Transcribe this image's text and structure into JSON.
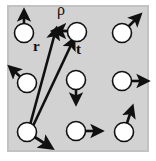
{
  "figure": {
    "kind": "spin-lattice-vector-diagram",
    "width": 156,
    "height": 161,
    "background_color": "#ffffff",
    "panel": {
      "fill_color": "#d2d2d2",
      "edge_color": "#9a9a9a",
      "x": 8,
      "y": 6,
      "width": 140,
      "height": 145
    },
    "site": {
      "fill_color": "#ffffff",
      "stroke_color": "#101010",
      "radius": 9.5
    },
    "arrow_color": "#101010"
  },
  "labels": {
    "rho": "ρ",
    "r": "r",
    "t": "t"
  },
  "lattice_sites": [
    {
      "name": "site-top-left",
      "cx": 24,
      "cy": 33,
      "spin_angle_deg": 90,
      "spin_length": 20
    },
    {
      "name": "site-top-center",
      "cx": 77,
      "cy": 32,
      "spin_angle_deg": 180,
      "spin_length": 21
    },
    {
      "name": "site-top-right",
      "cx": 122,
      "cy": 33,
      "spin_angle_deg": 45,
      "spin_length": 21
    },
    {
      "name": "site-middle-left",
      "cx": 27,
      "cy": 83,
      "spin_angle_deg": 138,
      "spin_length": 20
    },
    {
      "name": "site-middle-center",
      "cx": 76,
      "cy": 80,
      "spin_angle_deg": 270,
      "spin_length": 21
    },
    {
      "name": "site-middle-right",
      "cx": 122,
      "cy": 81,
      "spin_angle_deg": 0,
      "spin_length": 22
    },
    {
      "name": "site-bottom-left",
      "cx": 27,
      "cy": 132,
      "spin_angle_deg": -33,
      "spin_length": 24
    },
    {
      "name": "site-bottom-center",
      "cx": 76,
      "cy": 131,
      "spin_angle_deg": 0,
      "spin_length": 22
    },
    {
      "name": "site-bottom-right",
      "cx": 124,
      "cy": 132,
      "spin_angle_deg": 72,
      "spin_length": 24
    }
  ],
  "vectors": [
    {
      "name": "vector-r",
      "label": "r",
      "from_site": "site-bottom-left",
      "to_site": "site-top-center",
      "x1": 30,
      "y1": 126,
      "x2": 55,
      "y2": 32
    },
    {
      "name": "vector-t",
      "label": "t",
      "from_site": "site-bottom-left",
      "to_site": "site-top-center",
      "x1": 32,
      "y1": 127,
      "x2": 73,
      "y2": 42
    },
    {
      "name": "vector-rho",
      "label": "ρ",
      "from_site": "site-top-center",
      "to_site": "site-top-center-left",
      "x1": 77,
      "y1": 32,
      "x2": 56,
      "y2": 31
    }
  ]
}
